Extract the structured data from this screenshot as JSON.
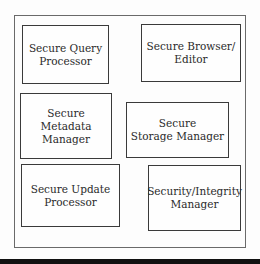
{
  "diagram": {
    "type": "component-block-diagram",
    "container_label": "",
    "components": [
      {
        "id": "query",
        "label": "Secure Query\nProcessor"
      },
      {
        "id": "browser",
        "label": "Secure Browser/\nEditor"
      },
      {
        "id": "metadata",
        "label": "Secure\nMetadata Manager"
      },
      {
        "id": "storage",
        "label": "Secure\nStorage Manager"
      },
      {
        "id": "update",
        "label": "Secure Update\nProcessor"
      },
      {
        "id": "integrity",
        "label": "Security/Integrity\nManager"
      }
    ]
  }
}
